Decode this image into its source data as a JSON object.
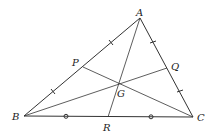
{
  "diagram": {
    "points": {
      "A": {
        "label": "A",
        "x": 140,
        "y": 18
      },
      "B": {
        "label": "B",
        "x": 24,
        "y": 116
      },
      "C": {
        "label": "C",
        "x": 193,
        "y": 117
      },
      "P": {
        "label": "P",
        "x": 83,
        "y": 67
      },
      "Q": {
        "label": "Q",
        "x": 167,
        "y": 68
      },
      "R": {
        "label": "R",
        "x": 108,
        "y": 117
      },
      "G": {
        "label": "G",
        "x": 118,
        "y": 84
      }
    },
    "segments": [
      "AB",
      "BC",
      "CA",
      "AR",
      "BQ",
      "CP"
    ],
    "tick_marks": {
      "AB": "single tick at quarter points (AP = PB)",
      "AC": "double tick (AQ = QC)",
      "BC": "circle marks (BR = RC)"
    },
    "line_color": "#333333"
  }
}
